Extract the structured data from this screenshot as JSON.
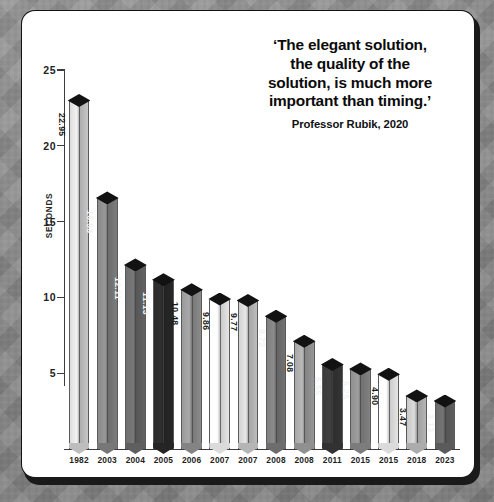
{
  "quote": {
    "line1": "‘The elegant solution,",
    "line2": "the quality of the",
    "line3": "solution, is much more",
    "line4": "important than timing.’",
    "attribution": "Professor Rubik, 2020"
  },
  "chart_data": {
    "type": "bar",
    "title": "",
    "xlabel": "",
    "ylabel": "SECONDS",
    "ylim": [
      0,
      25
    ],
    "yticks": [
      5,
      10,
      15,
      20,
      25
    ],
    "grid": false,
    "legend": "none",
    "categories": [
      "1982",
      "2003",
      "2004",
      "2005",
      "2006",
      "2007",
      "2007",
      "2008",
      "2008",
      "2011",
      "2015",
      "2015",
      "2018",
      "2023"
    ],
    "values": [
      22.95,
      16.53,
      12.11,
      11.13,
      10.48,
      9.86,
      9.77,
      8.72,
      7.08,
      5.55,
      5.25,
      4.9,
      3.47,
      3.13
    ],
    "value_labels": [
      "22.95",
      "16.53",
      "12.11",
      "11.13",
      "10.48",
      "9.86",
      "9.77",
      "8.72",
      "7.08",
      "5.55",
      "5.25",
      "4.90",
      "3.47",
      "3.13"
    ],
    "bar_colors": [
      "#dcdcdc",
      "#8a8a8a",
      "#6e6e6e",
      "#2b2b2b",
      "#9a9a9a",
      "#ffffff",
      "#d2d2d2",
      "#7f7f7f",
      "#a8a8a8",
      "#3a3a3a",
      "#909090",
      "#ffffff",
      "#c8c8c8",
      "#6a6a6a"
    ],
    "label_colors": [
      "#1a1a1a",
      "#f2f2f2",
      "#f5f5f5",
      "#f5f5f5",
      "#1a1a1a",
      "#1a1a1a",
      "#1a1a1a",
      "#f2f2f2",
      "#1a1a1a",
      "#f2f2f2",
      "#f2f2f2",
      "#1a1a1a",
      "#1a1a1a",
      "#f2f2f2"
    ],
    "cap_color": "#121212"
  },
  "colors": {
    "card": "#ffffff",
    "axis": "#3c3c3c",
    "backdrop": "#8d8d8d"
  }
}
